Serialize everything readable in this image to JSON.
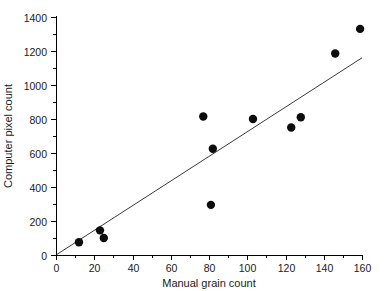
{
  "chart_data": {
    "type": "scatter",
    "title": "",
    "xlabel": "Manual grain count",
    "ylabel": "Computer pixel count",
    "xlim": [
      0,
      160
    ],
    "ylim": [
      0,
      1400
    ],
    "x_major_ticks": [
      0,
      20,
      40,
      60,
      80,
      100,
      120,
      140,
      160
    ],
    "x_major_tick_labels": [
      "0",
      "20",
      "40",
      "60",
      "80",
      "100",
      "120",
      "140",
      "160"
    ],
    "x_minor_ticks": [
      10,
      30,
      50,
      70,
      90,
      110,
      130,
      150
    ],
    "y_major_ticks": [
      0,
      200,
      400,
      600,
      800,
      1000,
      1200,
      1400
    ],
    "y_major_tick_labels": [
      "0",
      "200",
      "400",
      "600",
      "800",
      "1000",
      "1200",
      "1400"
    ],
    "y_minor_ticks": [
      100,
      300,
      500,
      700,
      900,
      1100,
      1300
    ],
    "grid": false,
    "legend": null,
    "points": [
      {
        "x": 12,
        "y": 75
      },
      {
        "x": 23,
        "y": 145
      },
      {
        "x": 25,
        "y": 100
      },
      {
        "x": 77,
        "y": 815
      },
      {
        "x": 81,
        "y": 295
      },
      {
        "x": 82,
        "y": 625
      },
      {
        "x": 103,
        "y": 800
      },
      {
        "x": 123,
        "y": 750
      },
      {
        "x": 128,
        "y": 810
      },
      {
        "x": 146,
        "y": 1185
      },
      {
        "x": 159,
        "y": 1330
      }
    ],
    "marker": {
      "shape": "circle",
      "size": 4.2,
      "color": "#0d0d0d"
    },
    "fit_line": {
      "x_start": 0,
      "y_start": 0,
      "x_end": 160,
      "y_end": 1160,
      "color": "#3a3a3a",
      "width": 1
    },
    "axis_color": "#000000",
    "background_color": "#ffffff"
  },
  "labels": {
    "x_axis_title": "Manual grain count",
    "y_axis_title": "Computer pixel count"
  }
}
